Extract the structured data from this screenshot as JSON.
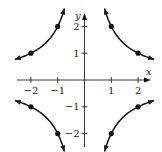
{
  "chart_data": {
    "type": "line",
    "title": "",
    "xlabel": "x",
    "ylabel": "y",
    "xlim": [
      -2.6,
      2.6
    ],
    "ylim": [
      -2.6,
      2.6
    ],
    "grid": false,
    "x_ticks": [
      -2,
      -1,
      1,
      2
    ],
    "y_ticks": [
      -2,
      -1,
      1,
      2
    ],
    "x_tick_labels": [
      "−2",
      "−1",
      "1",
      "2"
    ],
    "y_tick_labels": [
      "−2",
      "−1",
      "1",
      "2"
    ],
    "series": [
      {
        "name": "upper-left branch",
        "function": "y = 2/|x|",
        "x_range": [
          -2.6,
          -0.75
        ],
        "points": [
          [
            -2,
            1
          ],
          [
            -1,
            2
          ]
        ]
      },
      {
        "name": "upper-right branch",
        "function": "y = 2/|x|",
        "x_range": [
          0.75,
          2.6
        ],
        "points": [
          [
            1,
            2
          ],
          [
            2,
            1
          ]
        ]
      },
      {
        "name": "lower-left branch",
        "function": "y = -2/|x|",
        "x_range": [
          -2.6,
          -0.75
        ],
        "points": [
          [
            -2,
            -1
          ],
          [
            -1,
            -2
          ]
        ]
      },
      {
        "name": "lower-right branch",
        "function": "y = -2/|x|",
        "x_range": [
          0.75,
          2.6
        ],
        "points": [
          [
            1,
            -2
          ],
          [
            2,
            -1
          ]
        ]
      }
    ]
  }
}
